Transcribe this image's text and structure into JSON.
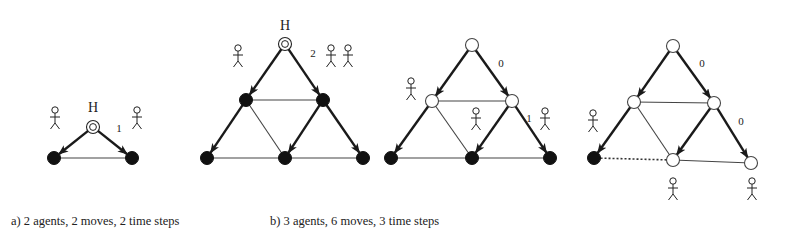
{
  "captions": {
    "a": "a) 2 agents, 2 moves, 2 time steps",
    "b": "b) 3 agents, 6 moves, 3 time steps"
  },
  "colors": {
    "ink": "#1a1a1a",
    "thin_edge": "#333333",
    "filled_node": "#111111"
  },
  "icons": {
    "agent": "stick-figure-icon",
    "home_marker": "double-circle-icon"
  },
  "panels": [
    {
      "id": "a",
      "home_label": "H",
      "nodes": [
        {
          "id": "top",
          "state": "home"
        },
        {
          "id": "bl",
          "state": "filled"
        },
        {
          "id": "br",
          "state": "filled"
        }
      ],
      "edges": [
        {
          "from": "top",
          "to": "bl",
          "type": "arrow"
        },
        {
          "from": "top",
          "to": "br",
          "type": "arrow"
        },
        {
          "from": "bl",
          "to": "br",
          "type": "line"
        }
      ],
      "labels": [
        {
          "text": "1",
          "near": "top-br"
        }
      ],
      "agents": [
        {
          "near": "top-left"
        },
        {
          "near": "top-right"
        }
      ]
    },
    {
      "id": "b1",
      "home_label": "H",
      "nodes": [
        {
          "id": "top",
          "state": "home"
        },
        {
          "id": "ml",
          "state": "filled"
        },
        {
          "id": "mr",
          "state": "filled"
        },
        {
          "id": "bl",
          "state": "filled"
        },
        {
          "id": "bm",
          "state": "filled"
        },
        {
          "id": "br",
          "state": "filled"
        }
      ],
      "edges": [
        {
          "from": "top",
          "to": "ml",
          "type": "arrow"
        },
        {
          "from": "top",
          "to": "mr",
          "type": "arrow"
        },
        {
          "from": "ml",
          "to": "mr",
          "type": "line"
        },
        {
          "from": "ml",
          "to": "bl",
          "type": "arrow"
        },
        {
          "from": "ml",
          "to": "bm",
          "type": "line"
        },
        {
          "from": "mr",
          "to": "bm",
          "type": "arrow"
        },
        {
          "from": "mr",
          "to": "br",
          "type": "arrow"
        },
        {
          "from": "bl",
          "to": "bm",
          "type": "line"
        },
        {
          "from": "bm",
          "to": "br",
          "type": "line"
        }
      ],
      "labels": [
        {
          "text": "2",
          "near": "top-mr"
        }
      ],
      "agents": [
        {
          "near": "top-left"
        },
        {
          "near": "top-right-1"
        },
        {
          "near": "top-right-2"
        }
      ]
    },
    {
      "id": "b2",
      "nodes": [
        {
          "id": "top",
          "state": "open"
        },
        {
          "id": "ml",
          "state": "open"
        },
        {
          "id": "mr",
          "state": "open"
        },
        {
          "id": "bl",
          "state": "filled"
        },
        {
          "id": "bm",
          "state": "filled"
        },
        {
          "id": "br",
          "state": "filled"
        }
      ],
      "edges": [
        {
          "from": "top",
          "to": "ml",
          "type": "arrow"
        },
        {
          "from": "top",
          "to": "mr",
          "type": "arrow"
        },
        {
          "from": "ml",
          "to": "mr",
          "type": "line"
        },
        {
          "from": "ml",
          "to": "bl",
          "type": "arrow"
        },
        {
          "from": "ml",
          "to": "bm",
          "type": "line"
        },
        {
          "from": "mr",
          "to": "bm",
          "type": "arrow"
        },
        {
          "from": "mr",
          "to": "br",
          "type": "arrow"
        },
        {
          "from": "bl",
          "to": "bm",
          "type": "line"
        },
        {
          "from": "bm",
          "to": "br",
          "type": "line"
        }
      ],
      "labels": [
        {
          "text": "0",
          "near": "top-mr"
        },
        {
          "text": "1",
          "near": "mr-br"
        }
      ],
      "agents": [
        {
          "near": "ml"
        },
        {
          "near": "center"
        },
        {
          "near": "mr-right"
        }
      ]
    },
    {
      "id": "b3",
      "nodes": [
        {
          "id": "top",
          "state": "open"
        },
        {
          "id": "ml",
          "state": "open"
        },
        {
          "id": "mr",
          "state": "open"
        },
        {
          "id": "bl",
          "state": "filled"
        },
        {
          "id": "bm",
          "state": "open"
        },
        {
          "id": "br",
          "state": "open"
        }
      ],
      "edges": [
        {
          "from": "top",
          "to": "ml",
          "type": "arrow"
        },
        {
          "from": "top",
          "to": "mr",
          "type": "arrow"
        },
        {
          "from": "ml",
          "to": "mr",
          "type": "line"
        },
        {
          "from": "ml",
          "to": "bl",
          "type": "arrow"
        },
        {
          "from": "ml",
          "to": "bm",
          "type": "line"
        },
        {
          "from": "mr",
          "to": "bm",
          "type": "arrow"
        },
        {
          "from": "mr",
          "to": "br",
          "type": "arrow"
        },
        {
          "from": "bm",
          "to": "bl",
          "type": "dotted-arrow"
        },
        {
          "from": "bm",
          "to": "br",
          "type": "line"
        }
      ],
      "labels": [
        {
          "text": "0",
          "near": "top-mr"
        },
        {
          "text": "0",
          "near": "mr-br"
        }
      ],
      "agents": [
        {
          "near": "left"
        },
        {
          "near": "below-bm"
        },
        {
          "near": "below-br"
        }
      ]
    }
  ]
}
